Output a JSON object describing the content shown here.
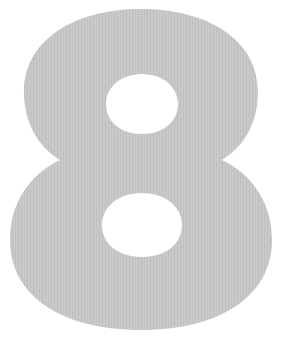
{
  "figure": {
    "glyph": "8",
    "colors": {
      "fill": "#c9c9c9",
      "texture": "#bdbdbd",
      "background": "#ffffff"
    }
  }
}
